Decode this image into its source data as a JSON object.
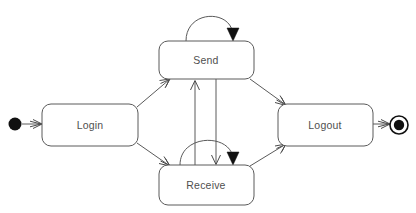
{
  "diagram": {
    "type": "uml-state-machine",
    "canvas": {
      "width": 416,
      "height": 213,
      "background": "#ffffff"
    },
    "colors": {
      "box_stroke": "#5a5a5a",
      "box_fill": "#ffffff",
      "edge_stroke": "#5a5a5a",
      "arrow_fill": "#111111",
      "label_text": "#4f4f4f",
      "pseudostate_fill": "#111111"
    },
    "states": [
      {
        "id": "login",
        "label": "Login",
        "kind": "state",
        "x": 42,
        "y": 104,
        "width": 96,
        "height": 42,
        "rx": 9,
        "label_x": 90,
        "label_y": 126
      },
      {
        "id": "send",
        "label": "Send",
        "kind": "state",
        "x": 159,
        "y": 41,
        "width": 95,
        "height": 38,
        "rx": 9,
        "label_x": 206,
        "label_y": 61
      },
      {
        "id": "receive",
        "label": "Receive",
        "kind": "state",
        "x": 159,
        "y": 165,
        "width": 95,
        "height": 40,
        "rx": 9,
        "label_x": 206,
        "label_y": 186
      },
      {
        "id": "logout",
        "label": "Logout",
        "kind": "state",
        "x": 278,
        "y": 104,
        "width": 95,
        "height": 42,
        "rx": 9,
        "label_x": 325,
        "label_y": 126
      }
    ],
    "pseudostates": [
      {
        "id": "initial",
        "kind": "initial",
        "label": "initial-state",
        "cx": 15,
        "cy": 124,
        "r": 6.5
      },
      {
        "id": "final",
        "kind": "final",
        "label": "final-state",
        "cx": 399,
        "cy": 125,
        "r_outer": 9,
        "r_inner": 5.2
      }
    ],
    "transitions": [
      {
        "id": "initial-to-login",
        "from": "initial",
        "to": "login",
        "label": "",
        "arrow": "open"
      },
      {
        "id": "login-to-send",
        "from": "login",
        "to": "send",
        "label": "",
        "arrow": "open"
      },
      {
        "id": "login-to-receive",
        "from": "login",
        "to": "receive",
        "label": "",
        "arrow": "open"
      },
      {
        "id": "send-to-receive",
        "from": "send",
        "to": "receive",
        "label": "",
        "arrow": "open"
      },
      {
        "id": "receive-to-send",
        "from": "receive",
        "to": "send",
        "label": "",
        "arrow": "open"
      },
      {
        "id": "send-self-loop",
        "from": "send",
        "to": "send",
        "label": "",
        "arrow": "solid"
      },
      {
        "id": "receive-self-loop",
        "from": "receive",
        "to": "receive",
        "label": "",
        "arrow": "solid"
      },
      {
        "id": "send-to-logout",
        "from": "send",
        "to": "logout",
        "label": "",
        "arrow": "open"
      },
      {
        "id": "receive-to-logout",
        "from": "receive",
        "to": "logout",
        "label": "",
        "arrow": "open"
      },
      {
        "id": "logout-to-final",
        "from": "logout",
        "to": "final",
        "label": "",
        "arrow": "open"
      }
    ]
  }
}
